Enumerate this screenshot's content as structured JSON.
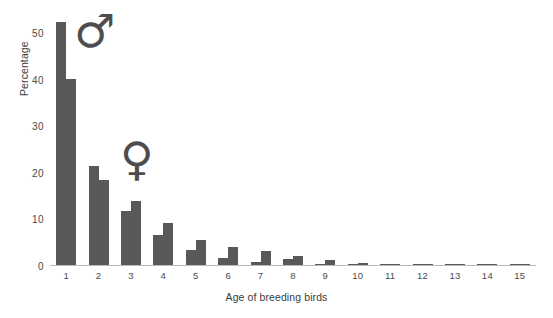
{
  "chart_data": {
    "type": "bar",
    "title": "",
    "subtitle": "",
    "xlabel": "Age of breeding birds",
    "ylabel": "Percentage",
    "categories": [
      "1",
      "2",
      "3",
      "4",
      "5",
      "6",
      "7",
      "8",
      "9",
      "10",
      "11",
      "12",
      "13",
      "14",
      "15"
    ],
    "series": [
      {
        "name": "Male",
        "symbol": "♂",
        "values": [
          52.5,
          21.5,
          11.8,
          6.6,
          3.5,
          1.8,
          0.9,
          1.6,
          0.4,
          0.2,
          0.2,
          0.2,
          0.2,
          0.2,
          0.2
        ]
      },
      {
        "name": "Female",
        "symbol": "♀",
        "values": [
          40.2,
          18.5,
          14.0,
          9.2,
          5.5,
          4.0,
          3.2,
          2.2,
          1.2,
          0.7,
          0.5,
          0.2,
          0.2,
          0.2,
          0.2
        ]
      }
    ],
    "ylim": [
      0,
      55
    ],
    "yticks": [
      0,
      10,
      20,
      30,
      40,
      50
    ],
    "grid": false,
    "legend": "none",
    "annotations": [
      {
        "name": "male-symbol",
        "text": "♂"
      },
      {
        "name": "female-symbol",
        "text": "♀"
      }
    ],
    "colors": {
      "bar": "#595959",
      "axis": "#b9b9b9",
      "text": "#3b3b3b",
      "tick_text": "#4a4a4a",
      "symbol": "#4d4d4d",
      "background": "#ffffff"
    }
  }
}
